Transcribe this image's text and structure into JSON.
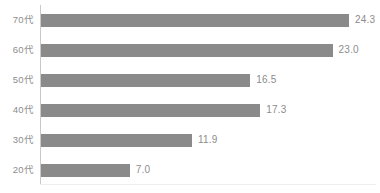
{
  "chart_data": {
    "type": "bar",
    "orientation": "horizontal",
    "title": "",
    "subtitle": "",
    "xlabel": "",
    "ylabel": "",
    "categories": [
      "70代",
      "60代",
      "50代",
      "40代",
      "30代",
      "20代"
    ],
    "values": [
      24.3,
      23.0,
      16.5,
      17.3,
      11.9,
      7.0
    ],
    "value_labels": [
      "24.3",
      "23.0",
      "16.5",
      "17.3",
      "11.9",
      "7.0"
    ],
    "series": [
      {
        "name": "",
        "values": [
          24.3,
          23.0,
          16.5,
          17.3,
          11.9,
          7.0
        ]
      }
    ],
    "xlim": [
      0,
      26.5
    ],
    "ylim": null,
    "grid": false,
    "legend": false,
    "legend_position": "none",
    "annotations": [],
    "colors": {
      "bar": "#8a8a8a",
      "label_text": "#8c8c8c",
      "value_text": "#8c8c8c",
      "axis_line": "#c9c9c9",
      "baseline": "#eeeeee",
      "background": "#ffffff"
    }
  }
}
